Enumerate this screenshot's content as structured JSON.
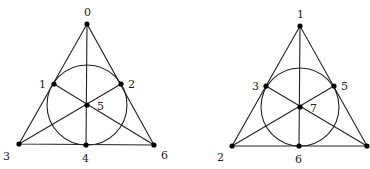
{
  "figures": [
    {
      "name": "fano-plane-left",
      "vertices": {
        "top": {
          "label": "0",
          "x": 87,
          "y": 24
        },
        "left": {
          "label": "1",
          "x": 54,
          "y": 84
        },
        "right": {
          "label": "2",
          "x": 121,
          "y": 84
        },
        "bl": {
          "label": "3",
          "x": 19,
          "y": 144
        },
        "bottom": {
          "label": "4",
          "x": 86,
          "y": 145
        },
        "center": {
          "label": "5",
          "x": 87,
          "y": 105
        },
        "br": {
          "label": "6",
          "x": 154,
          "y": 145
        }
      }
    },
    {
      "name": "fano-plane-right",
      "vertices": {
        "top": {
          "label": "1",
          "x": 300,
          "y": 26
        },
        "left": {
          "label": "3",
          "x": 266,
          "y": 86
        },
        "right": {
          "label": "5",
          "x": 334,
          "y": 86
        },
        "bl": {
          "label": "2",
          "x": 232,
          "y": 146
        },
        "bottom": {
          "label": "6",
          "x": 299,
          "y": 146
        },
        "center": {
          "label": "7",
          "x": 300,
          "y": 107
        },
        "br": {
          "label": "",
          "x": 367,
          "y": 146
        }
      }
    }
  ],
  "labels": {
    "left_0": "0",
    "left_1": "1",
    "left_2": "2",
    "left_3": "3",
    "left_4": "4",
    "left_5": "5",
    "left_6": "6",
    "right_1": "1",
    "right_3": "3",
    "right_5": "5",
    "right_2": "2",
    "right_6": "6",
    "right_7": "7"
  }
}
